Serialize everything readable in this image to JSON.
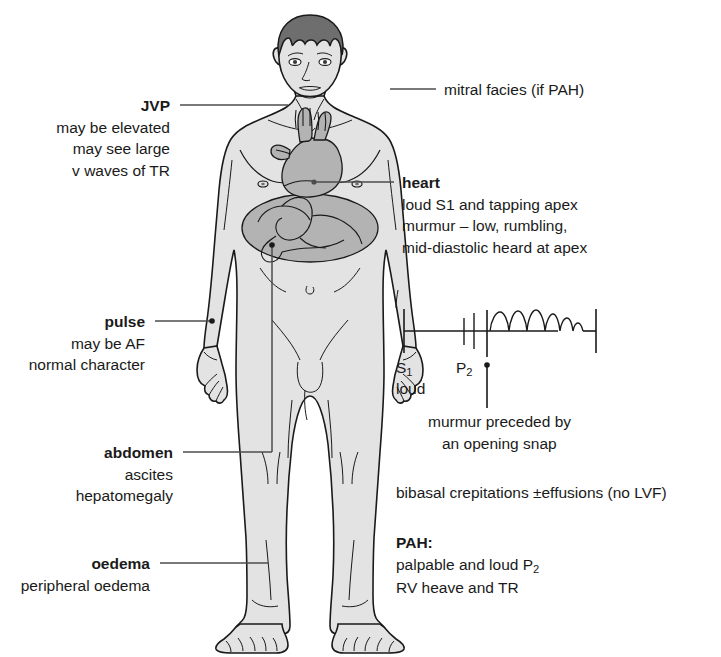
{
  "diagram": {
    "colors": {
      "skin_fill": "#e3e3e3",
      "organ_fill": "#b3b3b3",
      "hair_fill": "#6e6e6e",
      "outline": "#1a1a1a",
      "leader_line": "#4d4d4d",
      "text": "#1a1a1a"
    }
  },
  "labels": {
    "jvp": {
      "heading": "JVP",
      "lines": [
        "may be elevated",
        "may see large",
        "v waves of TR"
      ]
    },
    "pulse": {
      "heading": "pulse",
      "lines": [
        "may be AF",
        "normal character"
      ]
    },
    "abdomen": {
      "heading": "abdomen",
      "lines": [
        "ascites",
        "hepatomegaly"
      ]
    },
    "oedema": {
      "heading": "oedema",
      "lines": [
        "peripheral oedema"
      ]
    },
    "facies": {
      "heading": "mitral facies (if PAH)"
    },
    "heart": {
      "heading": "heart",
      "lines": [
        "loud S1 and tapping apex",
        "murmur – low, rumbling,",
        "mid-diastolic heard at apex"
      ]
    },
    "chest": {
      "text": "bibasal crepitations ±effusions (no LVF)"
    },
    "pah": {
      "heading": "PAH:",
      "line1_prefix": "palpable and loud P",
      "line1_sub": "2",
      "line2": "RV heave and TR"
    }
  },
  "phonocardiogram": {
    "s1_label_prefix": "S",
    "s1_label_sub": "1",
    "s1_caption": "loud",
    "p2_label_prefix": "P",
    "p2_label_sub": "2",
    "annotation": [
      "murmur preceded by",
      "an opening snap"
    ],
    "events": [
      "S1",
      "A2",
      "P2",
      "opening snap",
      "mid-diastolic murmur",
      "S1"
    ],
    "murmur_shape": "decrescendo rumbling arches"
  }
}
